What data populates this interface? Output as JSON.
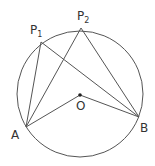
{
  "diagram": {
    "type": "circle-inscribed-angles",
    "stroke_color": "#555555",
    "circle": {
      "cx": 80,
      "cy": 94,
      "r": 63
    },
    "points": {
      "P1": {
        "x": 41,
        "y": 42,
        "label": "P",
        "sub": "1"
      },
      "P2": {
        "x": 81,
        "y": 28,
        "label": "P",
        "sub": "2"
      },
      "A": {
        "x": 26,
        "y": 127,
        "label": "A"
      },
      "B": {
        "x": 139,
        "y": 117,
        "label": "B"
      },
      "O": {
        "x": 80,
        "y": 95,
        "label": "O"
      }
    },
    "segments": [
      [
        "A",
        "P1"
      ],
      [
        "P1",
        "B"
      ],
      [
        "A",
        "P2"
      ],
      [
        "P2",
        "B"
      ],
      [
        "A",
        "O"
      ],
      [
        "O",
        "B"
      ]
    ]
  }
}
